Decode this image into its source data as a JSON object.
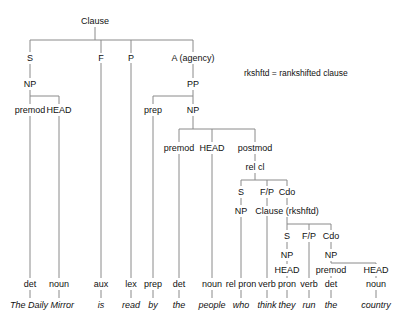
{
  "diagram": {
    "note": "rkshftd = rankshifted clause",
    "nodes": [
      {
        "id": "clause",
        "label": "Clause",
        "x": 95,
        "y": 21
      },
      {
        "id": "s",
        "label": "S",
        "x": 30,
        "y": 58
      },
      {
        "id": "f",
        "label": "F",
        "x": 101,
        "y": 58
      },
      {
        "id": "p",
        "label": "P",
        "x": 131,
        "y": 58
      },
      {
        "id": "a",
        "label": "A (agency)",
        "x": 193,
        "y": 58
      },
      {
        "id": "np1",
        "label": "NP",
        "x": 30,
        "y": 84
      },
      {
        "id": "pp",
        "label": "PP",
        "x": 193,
        "y": 84
      },
      {
        "id": "premod1",
        "label": "premod",
        "x": 30,
        "y": 110
      },
      {
        "id": "head1",
        "label": "HEAD",
        "x": 59,
        "y": 110
      },
      {
        "id": "prep1",
        "label": "prep",
        "x": 153,
        "y": 110
      },
      {
        "id": "np2",
        "label": "NP",
        "x": 193,
        "y": 110
      },
      {
        "id": "premod2",
        "label": "premod",
        "x": 179,
        "y": 148
      },
      {
        "id": "head2",
        "label": "HEAD",
        "x": 212,
        "y": 148
      },
      {
        "id": "postmod",
        "label": "postmod",
        "x": 255,
        "y": 148
      },
      {
        "id": "relcl",
        "label": "rel cl",
        "x": 255,
        "y": 167
      },
      {
        "id": "s2",
        "label": "S",
        "x": 241,
        "y": 192
      },
      {
        "id": "fp1",
        "label": "F/P",
        "x": 267,
        "y": 192
      },
      {
        "id": "cdo1",
        "label": "Cdo",
        "x": 287,
        "y": 192
      },
      {
        "id": "np3",
        "label": "NP",
        "x": 241,
        "y": 211
      },
      {
        "id": "clause2",
        "label": "Clause (rkshftd)",
        "x": 287,
        "y": 211
      },
      {
        "id": "s3",
        "label": "S",
        "x": 287,
        "y": 236
      },
      {
        "id": "fp2",
        "label": "F/P",
        "x": 309,
        "y": 236
      },
      {
        "id": "cdo2",
        "label": "Cdo",
        "x": 331,
        "y": 236
      },
      {
        "id": "np4",
        "label": "NP",
        "x": 287,
        "y": 255
      },
      {
        "id": "np5",
        "label": "NP",
        "x": 331,
        "y": 255
      },
      {
        "id": "head3",
        "label": "HEAD",
        "x": 287,
        "y": 270
      },
      {
        "id": "premod3",
        "label": "premod",
        "x": 331,
        "y": 270
      },
      {
        "id": "head4",
        "label": "HEAD",
        "x": 376,
        "y": 270
      }
    ],
    "pos": [
      {
        "label": "det",
        "x": 30
      },
      {
        "label": "noun",
        "x": 59
      },
      {
        "label": "aux",
        "x": 101
      },
      {
        "label": "lex",
        "x": 131
      },
      {
        "label": "prep",
        "x": 153
      },
      {
        "label": "det",
        "x": 179
      },
      {
        "label": "noun",
        "x": 212
      },
      {
        "label": "rel pron",
        "x": 241
      },
      {
        "label": "verb",
        "x": 267
      },
      {
        "label": "pron",
        "x": 287
      },
      {
        "label": "verb",
        "x": 309
      },
      {
        "label": "det",
        "x": 331
      },
      {
        "label": "noun",
        "x": 376
      }
    ],
    "words": [
      {
        "label": "The Daily Mirror",
        "x": 42
      },
      {
        "label": "is",
        "x": 101
      },
      {
        "label": "read",
        "x": 131
      },
      {
        "label": "by",
        "x": 153
      },
      {
        "label": "the",
        "x": 179
      },
      {
        "label": "people",
        "x": 212
      },
      {
        "label": "who",
        "x": 241
      },
      {
        "label": "think",
        "x": 267
      },
      {
        "label": "they",
        "x": 287
      },
      {
        "label": "run",
        "x": 309
      },
      {
        "label": "the",
        "x": 331
      },
      {
        "label": "country",
        "x": 376
      }
    ],
    "line_color": "#8a8a8a"
  }
}
